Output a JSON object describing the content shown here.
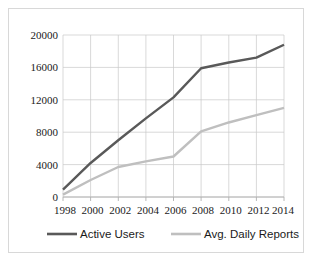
{
  "chart_data": {
    "type": "line",
    "title": "",
    "subtitle": "",
    "xlabel": "",
    "ylabel": "",
    "x": [
      1998,
      2000,
      2002,
      2004,
      2006,
      2008,
      2010,
      2012,
      2014
    ],
    "categories": [
      "1998",
      "2000",
      "2002",
      "2004",
      "2006",
      "2008",
      "2010",
      "2012",
      "2014"
    ],
    "series": [
      {
        "name": "Active Users",
        "color": "#595959",
        "values": [
          900,
          4200,
          7000,
          9700,
          12300,
          15900,
          16600,
          17200,
          18800
        ]
      },
      {
        "name": "Avg. Daily Reports",
        "color": "#bfbfbf",
        "values": [
          300,
          2100,
          3700,
          4400,
          5000,
          8100,
          9200,
          10100,
          11000
        ]
      }
    ],
    "ylim": [
      0,
      20000
    ],
    "xlim": [
      1998,
      2014
    ],
    "yticks": [
      0,
      4000,
      8000,
      12000,
      16000,
      20000
    ],
    "ytick_labels": [
      "0",
      "4000",
      "8000",
      "12000",
      "16000",
      "20000"
    ],
    "xtick_labels": [
      "1998",
      "2000",
      "2002",
      "2004",
      "2006",
      "2008",
      "2010",
      "2012",
      "2014"
    ],
    "grid": true,
    "legend_position": "bottom",
    "legend": [
      {
        "label": "Active Users",
        "color": "#595959"
      },
      {
        "label": "Avg. Daily Reports",
        "color": "#bfbfbf"
      }
    ]
  },
  "axis": {
    "y_labels": [
      "20000",
      "16000",
      "12000",
      "8000",
      "4000",
      "0"
    ],
    "x_labels": [
      "1998",
      "2000",
      "2002",
      "2004",
      "2006",
      "2008",
      "2010",
      "2012",
      "2014"
    ]
  },
  "legend": {
    "items": [
      {
        "label": "Active Users"
      },
      {
        "label": "Avg. Daily Reports"
      }
    ]
  }
}
